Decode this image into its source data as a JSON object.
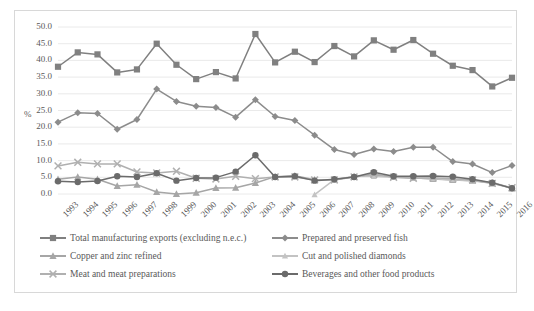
{
  "chart_data": {
    "type": "line",
    "title": "",
    "xlabel": "",
    "ylabel": "%",
    "ylim": [
      0.0,
      50.0
    ],
    "ytick_step": 5.0,
    "yticks": [
      "0.0",
      "5.0",
      "10.0",
      "15.0",
      "20.0",
      "25.0",
      "30.0",
      "35.0",
      "40.0",
      "45.0",
      "50.0"
    ],
    "grid": true,
    "grid_axis": "y",
    "legend_position": "bottom",
    "legend_columns": 2,
    "categories": [
      "1993",
      "1994",
      "1995",
      "1996",
      "1997",
      "1998",
      "1999",
      "2000",
      "2001",
      "2002",
      "2003",
      "2004",
      "2005",
      "2006",
      "2007",
      "2008",
      "2009",
      "2010",
      "2011",
      "2012",
      "2013",
      "2014",
      "2015",
      "2016"
    ],
    "series": [
      {
        "name": "Total manufacturing exports (excluding n.e.c.)",
        "marker": "square",
        "color": "#808080",
        "values": [
          38.1,
          42.4,
          41.8,
          36.4,
          37.3,
          45.0,
          38.7,
          34.4,
          36.5,
          34.6,
          47.9,
          39.4,
          42.6,
          39.5,
          44.3,
          41.2,
          46.0,
          43.2,
          46.1,
          42.0,
          38.4,
          37.1,
          32.2,
          34.8
        ]
      },
      {
        "name": "Prepared and preserved fish",
        "marker": "diamond",
        "color": "#8c8c8c",
        "values": [
          21.5,
          24.3,
          24.1,
          19.4,
          22.3,
          31.4,
          27.7,
          26.3,
          25.9,
          23.0,
          28.2,
          23.2,
          22.0,
          17.6,
          13.3,
          11.8,
          13.5,
          12.7,
          14.0,
          14.0,
          9.7,
          9.0,
          6.4,
          8.5
        ]
      },
      {
        "name": "Copper and zinc refined",
        "marker": "triangle",
        "color": "#a6a6a6",
        "values": [
          4.4,
          5.1,
          4.4,
          2.4,
          2.8,
          0.6,
          0.0,
          0.4,
          1.8,
          1.9,
          3.3,
          5.2,
          5.5,
          4.3,
          4.3,
          5.2,
          5.7,
          5.2,
          4.9,
          4.5,
          4.2,
          4.0,
          3.2,
          1.7
        ]
      },
      {
        "name": "Cut and polished diamonds",
        "marker": "small-triangle",
        "color": "#c3c3c3",
        "values": [
          null,
          null,
          null,
          null,
          null,
          null,
          null,
          null,
          null,
          null,
          null,
          null,
          null,
          -0.2,
          4.3,
          5.3,
          5.3,
          5.0,
          4.8,
          4.6,
          4.3,
          4.0,
          3.5,
          1.8
        ]
      },
      {
        "name": "Meat and meat preparations",
        "marker": "cross",
        "color": "#b0b0b0",
        "values": [
          8.4,
          9.5,
          9.0,
          9.0,
          6.6,
          6.3,
          6.8,
          4.7,
          4.5,
          5.3,
          4.6,
          5.1,
          5.1,
          4.2,
          4.2,
          5.1,
          6.0,
          5.0,
          4.7,
          4.9,
          4.6,
          4.2,
          3.2,
          1.9
        ]
      },
      {
        "name": "Beverages and other food products",
        "marker": "circle",
        "color": "#6b6b6b",
        "values": [
          3.8,
          3.6,
          3.9,
          5.3,
          5.1,
          6.2,
          4.0,
          4.8,
          4.9,
          6.7,
          11.6,
          5.1,
          5.3,
          4.0,
          4.4,
          5.1,
          6.5,
          5.3,
          5.3,
          5.4,
          5.2,
          4.4,
          3.4,
          1.7
        ]
      }
    ]
  },
  "legend": {
    "entries": [
      "Total manufacturing exports (excluding n.e.c.)",
      "Prepared and preserved fish",
      "Copper and zinc refined",
      "Cut and polished diamonds",
      "Meat and meat preparations",
      "Beverages and other food products"
    ]
  }
}
